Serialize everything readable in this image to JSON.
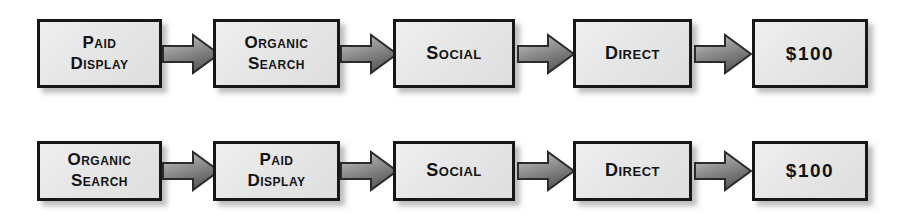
{
  "diagram": {
    "type": "flow-diagram",
    "title": "",
    "background_color": "#ffffff",
    "box_fill_color": "#e6e6e6",
    "box_border_color": "#17171a",
    "arrow_fill_color": "#8a8a8a",
    "arrow_border_color": "#2b2b2b",
    "text_color": "#131316",
    "rows": [
      {
        "name": "row-1",
        "steps": [
          {
            "label": "Paid\nDisplay",
            "kind": "channel"
          },
          {
            "label": "Organic\nSearch",
            "kind": "channel"
          },
          {
            "label": "Social",
            "kind": "channel"
          },
          {
            "label": "Direct",
            "kind": "channel"
          },
          {
            "label": "$100",
            "kind": "value"
          }
        ],
        "connectors": [
          "arrow-right",
          "arrow-right",
          "arrow-right",
          "arrow-right"
        ]
      },
      {
        "name": "row-2",
        "steps": [
          {
            "label": "Organic\nSearch",
            "kind": "channel"
          },
          {
            "label": "Paid\nDisplay",
            "kind": "channel"
          },
          {
            "label": "Social",
            "kind": "channel"
          },
          {
            "label": "Direct",
            "kind": "channel"
          },
          {
            "label": "$100",
            "kind": "value"
          }
        ],
        "connectors": [
          "arrow-right",
          "arrow-right",
          "arrow-right",
          "arrow-right"
        ]
      }
    ]
  }
}
